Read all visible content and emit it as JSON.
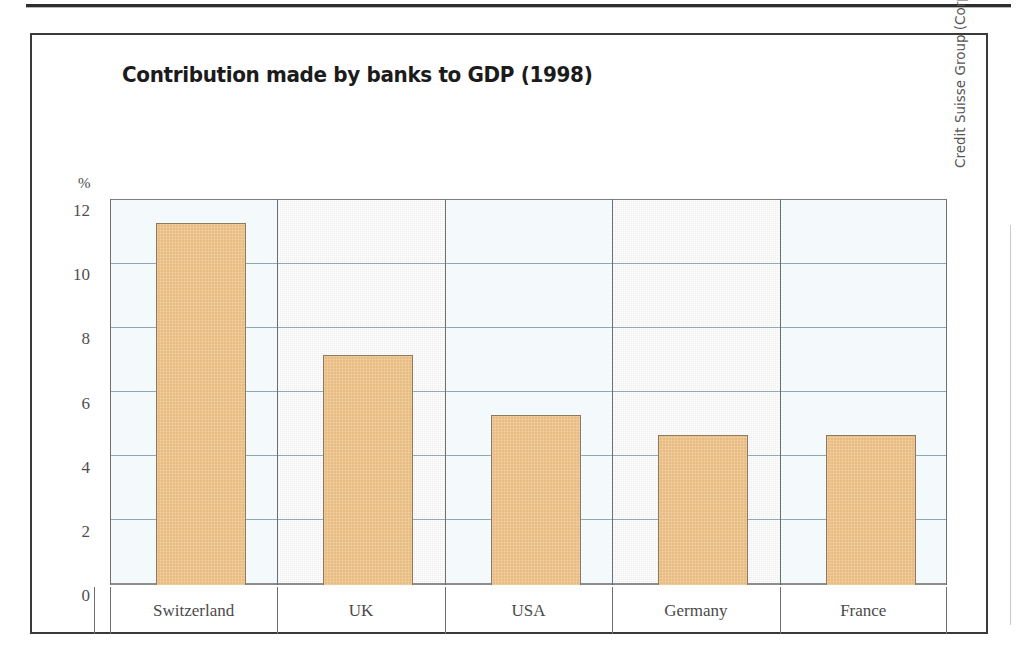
{
  "figure": {
    "title": "Contribution made by banks to GDP (1998)",
    "y_unit": "%",
    "credit": "Credit Suisse Group (Corporate History and Archives) 2000"
  },
  "colors": {
    "bar_fill": "#e9bd81",
    "bar_stroke": "#8a7a62",
    "gridline": "#8fa9b8",
    "band_light": "#f4f9fb",
    "band_shaded": "#ededed",
    "frame": "#3a3a3a",
    "title_text": "#1b1b1b",
    "tick_text": "#4f4f4f"
  },
  "chart_data": {
    "type": "bar",
    "title": "Contribution made by banks to GDP (1998)",
    "xlabel": "",
    "ylabel": "%",
    "ylim": [
      0,
      12
    ],
    "yticks": [
      0,
      2,
      4,
      6,
      8,
      10,
      12
    ],
    "ytick_labels": [
      "0",
      "2",
      "4",
      "6",
      "8",
      "10",
      "12"
    ],
    "grid": true,
    "legend": "none",
    "categories": [
      "Switzerland",
      "UK",
      "USA",
      "Germany",
      "France"
    ],
    "values": [
      11.3,
      7.2,
      5.3,
      4.7,
      4.7
    ],
    "annotations": [
      "Credit Suisse Group (Corporate History and Archives) 2000"
    ]
  }
}
